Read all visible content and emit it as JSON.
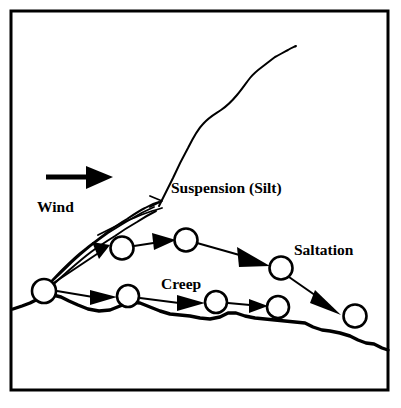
{
  "figure": {
    "background_color": "#ffffff",
    "ink_color": "#000000",
    "frame": {
      "x": 11,
      "y": 11,
      "width": 377,
      "height": 379,
      "stroke_width": 3
    }
  },
  "labels": {
    "wind": "Wind",
    "suspension": "Suspension (Silt)",
    "saltation": "Saltation",
    "creep": "Creep"
  },
  "label_positions": {
    "wind": {
      "x": 37,
      "y": 212
    },
    "suspension": {
      "x": 171,
      "y": 193
    },
    "saltation": {
      "x": 294,
      "y": 255
    },
    "creep": {
      "x": 161,
      "y": 289
    }
  },
  "wind_arrow": {
    "shaft_x1": 46,
    "shaft_y1": 177,
    "shaft_x2": 88,
    "shaft_y2": 177,
    "head_points": "86,166 113,177 86,189",
    "stroke_width": 5
  },
  "ground": {
    "stroke_width": 3.4,
    "path": "M 13,309 L 22,306 L 30,303 L 38,299 L 46,296 L 53,295 L 61,297 L 69,301 L 78,305 L 88,309 L 99,311 L 110,310 L 120,306 L 130,302 L 140,303 L 150,307 L 160,311 L 170,314 L 180,315 L 190,316 L 200,318 L 210,319 L 220,317 L 228,313 L 236,313 L 245,316 L 255,318 L 265,319 L 275,320 L 285,321 L 295,322 L 305,323 L 313,327 L 322,330 L 330,331 L 340,333 L 350,336 L 358,340 L 366,343 L 374,344 L 382,348 L 388,350"
  },
  "suspension_curve": {
    "stroke_width": 2.0,
    "path": "M 159,206 C 163,198 168,188 173,178 C 178,167 183,157 188,148 C 193,138 197,130 203,124 C 209,117 215,114 221,110 C 227,106 232,101 237,95 C 242,89 246,83 250,78 C 254,73 258,70 262,67 C 266,64 271,60 275,57 C 279,55 284,52 288,50 C 291,48 294,47 296,46"
  },
  "plume_edges": [
    {
      "stroke_width": 2.0,
      "path": "M 43,290 C 49,284 55,277 62,270 C 69,263 76,256 84,250 C 91,244 99,239 106,233 C 113,228 120,223 127,219 C 133,215 139,211 145,208 C 150,205 155,203 159,202"
    },
    {
      "stroke_width": 2.0,
      "path": "M 45,292 C 52,286 59,279 67,272 C 75,265 83,258 91,252 C 99,246 107,241 115,236 C 122,231 130,226 137,222 C 143,218 150,214 156,211"
    },
    {
      "stroke_width": 1.8,
      "path": "M 44,289 C 52,281 60,274 68,266 C 74,260 81,254 87,249 C 94,243 101,238 108,233 C 116,228 124,223 131,219 C 139,214 147,210 154,207"
    },
    {
      "stroke_width": 1.8,
      "path": "M 98,235 C 104,232 110,229 116,226 C 122,223 128,220 134,218 C 140,215 146,213 152,211 C 156,210 159,209 162,208"
    }
  ],
  "impact_point": {
    "cx": 44,
    "cy": 291,
    "r": 12,
    "stroke_width": 2.6
  },
  "saltation_path": {
    "description": "Bouncing grain trajectory from impact point rightward and downward",
    "stroke_width": 2.0,
    "grains": [
      {
        "id": "saltation-grain-1",
        "cx": 122,
        "cy": 248,
        "r": 11.5
      },
      {
        "id": "saltation-grain-2",
        "cx": 186,
        "cy": 240,
        "r": 11.5
      },
      {
        "id": "saltation-grain-3",
        "cx": 281,
        "cy": 268,
        "r": 11.5
      },
      {
        "id": "saltation-grain-4",
        "cx": 355,
        "cy": 316,
        "r": 11.5
      }
    ],
    "segments": [
      {
        "x1": 52,
        "y1": 284,
        "x2": 100,
        "y2": 252,
        "head": "92,242 110,245 99,259"
      },
      {
        "x1": 134,
        "y1": 246,
        "x2": 160,
        "y2": 242,
        "head": "152,233 176,240 154,250"
      },
      {
        "x1": 197,
        "y1": 243,
        "x2": 243,
        "y2": 256,
        "head": "237,247 270,266 239,267"
      },
      {
        "x1": 289,
        "y1": 277,
        "x2": 322,
        "y2": 300,
        "head": "315,290 341,315 310,303"
      }
    ]
  },
  "creep_path": {
    "description": "Surface creep grains rolling along the ground",
    "stroke_width": 1.8,
    "grains": [
      {
        "id": "creep-grain-1",
        "cx": 128,
        "cy": 296,
        "r": 11.0
      },
      {
        "id": "creep-grain-2",
        "cx": 216,
        "cy": 302,
        "r": 11.0
      },
      {
        "id": "creep-grain-3",
        "cx": 278,
        "cy": 307,
        "r": 11.0
      }
    ],
    "segments": [
      {
        "x1": 57,
        "y1": 291,
        "x2": 93,
        "y2": 297,
        "head": "90,290 117,297 90,305"
      },
      {
        "x1": 140,
        "y1": 298,
        "x2": 179,
        "y2": 303,
        "head": "177,295 205,303 177,311"
      },
      {
        "x1": 228,
        "y1": 303,
        "x2": 250,
        "y2": 305,
        "head": "249,299 268,306 249,313"
      }
    ]
  },
  "suspension_arrow_tick": {
    "path": "M 150,196 L 162,201 L 150,207",
    "stroke_width": 1.8
  }
}
